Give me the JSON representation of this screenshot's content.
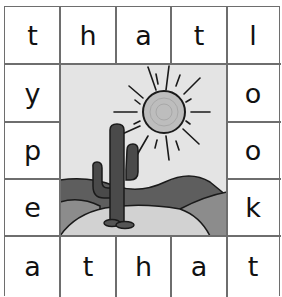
{
  "puzzle": {
    "top_row": [
      "t",
      "h",
      "a",
      "t",
      "l"
    ],
    "left_column": [
      "y",
      "p",
      "e"
    ],
    "right_column": [
      "o",
      "o",
      "k"
    ],
    "bottom_row": [
      "a",
      "t",
      "h",
      "a",
      "t"
    ]
  },
  "picture": {
    "subject": "desert scene with cactus and sun",
    "colors": {
      "sky": "#e4e4e4",
      "sun_fill": "#bdbdbd",
      "sun_outline": "#222222",
      "cactus": "#4a4a4a",
      "far_hills": "#5e5e5e",
      "mid_hills": "#8c8c8c",
      "sand": "#d2d2d2",
      "outline": "#1a1a1a"
    }
  }
}
